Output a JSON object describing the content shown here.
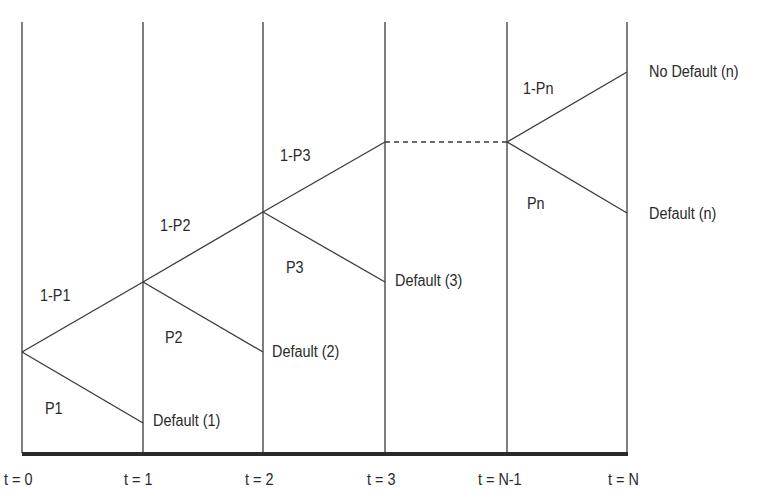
{
  "diagram": {
    "type": "binomial default tree",
    "time_labels": [
      "t = 0",
      "t = 1",
      "t = 2",
      "t = 3",
      "t = N-1",
      "t = N"
    ],
    "branch_labels": {
      "no_default": [
        "1-P1",
        "1-P2",
        "1-P3",
        "1-Pn"
      ],
      "default": [
        "P1",
        "P2",
        "P3",
        "Pn"
      ]
    },
    "outcomes": {
      "default_1": "Default (1)",
      "default_2": "Default (2)",
      "default_3": "Default (3)",
      "default_n": "Default (n)",
      "no_default_n": "No Default (n)"
    },
    "colors": {
      "line": "#3a3a3a",
      "axis": "#2a2a2a",
      "text": "#2a2a2a"
    }
  }
}
